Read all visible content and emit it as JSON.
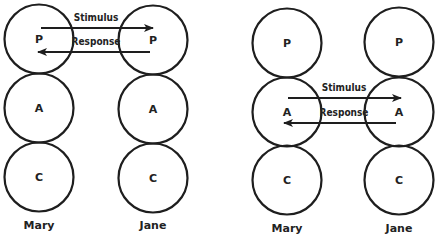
{
  "diagrams": [
    {
      "id": "parent-parent",
      "people": [
        {
          "name": "Mary",
          "cx": 39,
          "states": [
            {
              "letter": "P",
              "cy": 39
            },
            {
              "letter": "A",
              "cy": 108
            },
            {
              "letter": "C",
              "cy": 177
            }
          ],
          "label_y": 229
        },
        {
          "name": "Jane",
          "cx": 153,
          "states": [
            {
              "letter": "P",
              "cy": 40
            },
            {
              "letter": "A",
              "cy": 109
            },
            {
              "letter": "C",
              "cy": 178
            }
          ],
          "label_y": 229
        }
      ],
      "transactions": [
        {
          "label": "Stimulus",
          "x1": 41,
          "x2": 153,
          "y": 28,
          "direction": "right",
          "label_x": 96,
          "label_y": 21
        },
        {
          "label": "Response",
          "x1": 150,
          "x2": 38,
          "y": 52,
          "direction": "left",
          "label_x": 96,
          "label_y": 45
        }
      ]
    },
    {
      "id": "adult-adult",
      "people": [
        {
          "name": "Mary",
          "cx": 287,
          "states": [
            {
              "letter": "P",
              "cy": 43
            },
            {
              "letter": "A",
              "cy": 112
            },
            {
              "letter": "C",
              "cy": 180
            }
          ],
          "label_y": 232
        },
        {
          "name": "Jane",
          "cx": 399,
          "states": [
            {
              "letter": "P",
              "cy": 42
            },
            {
              "letter": "A",
              "cy": 112
            },
            {
              "letter": "C",
              "cy": 180
            }
          ],
          "label_y": 232
        }
      ],
      "transactions": [
        {
          "label": "Stimulus",
          "x1": 288,
          "x2": 401,
          "y": 98,
          "direction": "right",
          "label_x": 344,
          "label_y": 91
        },
        {
          "label": "Response",
          "x1": 396,
          "x2": 284,
          "y": 123,
          "direction": "left",
          "label_x": 344,
          "label_y": 116
        }
      ]
    }
  ],
  "style": {
    "radius": 34.5,
    "stroke": "#1e1e1e",
    "background": "#ffffff"
  }
}
